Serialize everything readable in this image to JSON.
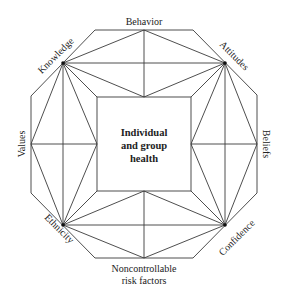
{
  "diagram": {
    "center_label": [
      "Individual",
      "and group",
      "health"
    ],
    "labels": {
      "top": "Behavior",
      "top_right": "Attitudes",
      "right": "Beliefs",
      "bottom_right": "Confidence",
      "bottom": [
        "Noncontrollable",
        "risk factors"
      ],
      "bottom_left": "Ethnicity",
      "left": "Values",
      "top_left": "Knowledge"
    },
    "colors": {
      "line": "#3a3a3a",
      "text": "#222222",
      "background": "#ffffff"
    }
  }
}
